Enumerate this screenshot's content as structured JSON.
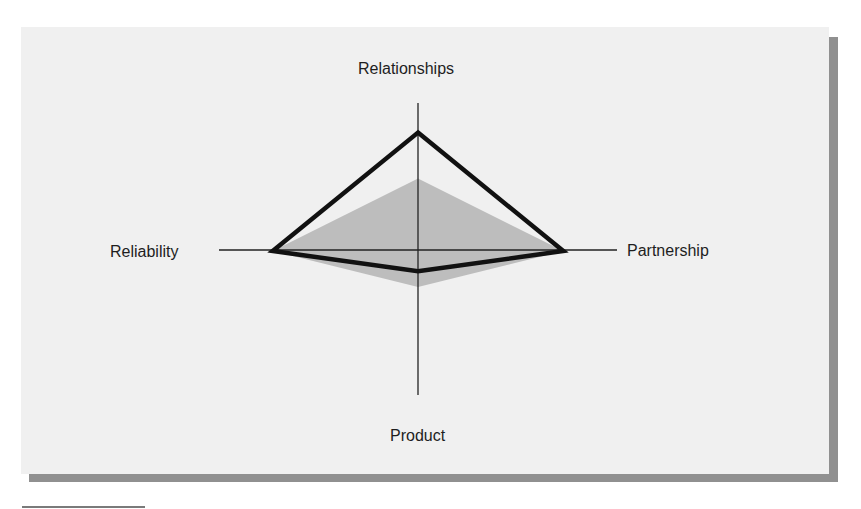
{
  "chart_data": {
    "type": "radar",
    "title": "",
    "axes": [
      "Relationships",
      "Partnership",
      "Product",
      "Reliability"
    ],
    "axis_max": 1.0,
    "grid": false,
    "legend": null,
    "series": [
      {
        "name": "Outline profile (black)",
        "style": "outline",
        "stroke": "#111111",
        "values": [
          0.8,
          0.73,
          0.14,
          0.73
        ]
      },
      {
        "name": "Filled profile (gray)",
        "style": "fill",
        "fill": "#bdbdbd",
        "values": [
          0.49,
          0.73,
          0.25,
          0.73
        ]
      }
    ]
  },
  "labels": {
    "top": "Relationships",
    "right": "Partnership",
    "bottom": "Product",
    "left": "Reliability"
  },
  "colors": {
    "panel": "#f0f0f0",
    "shadow": "#909090",
    "axis": "#222222",
    "outline": "#111111",
    "fill": "#bdbdbd"
  }
}
